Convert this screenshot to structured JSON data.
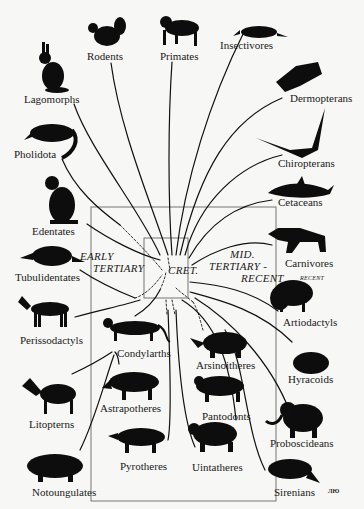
{
  "diagram": {
    "type": "mammalian-radiation-phylogeny",
    "center_label": "CRET.",
    "era_labels": {
      "early": [
        "EARLY",
        "TERTIARY"
      ],
      "mid": [
        "MID.",
        "TERTIARY -",
        "RECENT"
      ],
      "carnivore_note": "RECENT"
    },
    "taxa": [
      {
        "id": "rodents",
        "label": "Rodents",
        "icon": "squirrel-silhouette-icon"
      },
      {
        "id": "primates",
        "label": "Primates",
        "icon": "monkey-silhouette-icon"
      },
      {
        "id": "insectivores",
        "label": "Insectivores",
        "icon": "shrew-silhouette-icon"
      },
      {
        "id": "lagomorphs",
        "label": "Lagomorphs",
        "icon": "rabbit-silhouette-icon"
      },
      {
        "id": "dermopterans",
        "label": "Dermopterans",
        "icon": "colugo-silhouette-icon"
      },
      {
        "id": "pholidota",
        "label": "Pholidota",
        "icon": "pangolin-silhouette-icon"
      },
      {
        "id": "chiropterans",
        "label": "Chiropterans",
        "icon": "bat-silhouette-icon"
      },
      {
        "id": "cetaceans",
        "label": "Cetaceans",
        "icon": "dolphin-silhouette-icon"
      },
      {
        "id": "edentates",
        "label": "Edentates",
        "icon": "ground-sloth-silhouette-icon"
      },
      {
        "id": "carnivores",
        "label": "Carnivores",
        "icon": "hyena-silhouette-icon"
      },
      {
        "id": "tubulidentates",
        "label": "Tubulidentates",
        "icon": "aardvark-silhouette-icon"
      },
      {
        "id": "artiodactyls",
        "label": "Artiodactyls",
        "icon": "bison-silhouette-icon"
      },
      {
        "id": "perissodactyls",
        "label": "Perissodactyls",
        "icon": "horse-silhouette-icon"
      },
      {
        "id": "condylarths",
        "label": "Condylarths",
        "icon": "condylarth-silhouette-icon"
      },
      {
        "id": "arsinoitheres",
        "label": "Arsinoitheres",
        "icon": "arsinoithere-silhouette-icon"
      },
      {
        "id": "hyracoids",
        "label": "Hyracoids",
        "icon": "hyrax-silhouette-icon"
      },
      {
        "id": "litopterns",
        "label": "Litopterns",
        "icon": "litoptern-silhouette-icon"
      },
      {
        "id": "astrapotheres",
        "label": "Astrapotheres",
        "icon": "astrapothere-silhouette-icon"
      },
      {
        "id": "pantodonts",
        "label": "Pantodonts",
        "icon": "pantodont-silhouette-icon"
      },
      {
        "id": "proboscideans",
        "label": "Proboscideans",
        "icon": "elephant-silhouette-icon"
      },
      {
        "id": "pyrotheres",
        "label": "Pyrotheres",
        "icon": "pyrothere-silhouette-icon"
      },
      {
        "id": "uintatheres",
        "label": "Uintatheres",
        "icon": "uintathere-silhouette-icon"
      },
      {
        "id": "notoungulates",
        "label": "Notoungulates",
        "icon": "toxodon-silhouette-icon"
      },
      {
        "id": "sirenians",
        "label": "Sirenians",
        "icon": "manatee-silhouette-icon"
      }
    ],
    "signature": "ЛЮ",
    "colors": {
      "ink": "#111111",
      "background": "#f7f7f5",
      "box": "#444444"
    }
  }
}
